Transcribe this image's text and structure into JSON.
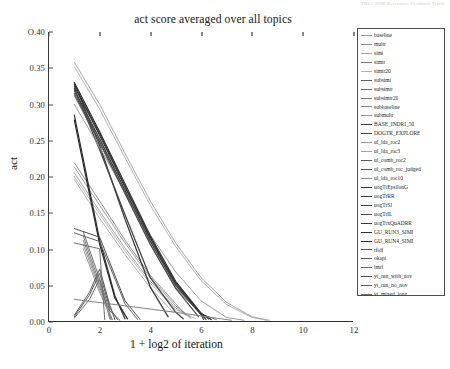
{
  "header": {
    "scan_artifact": "TREC 2008 Relevance Feedback Track"
  },
  "chart_data": {
    "type": "line",
    "title": "act score averaged over all topics",
    "xlabel": "1 + log2 of iteration",
    "ylabel": "act",
    "xlim": [
      0,
      12
    ],
    "ylim": [
      0.0,
      0.4
    ],
    "xticks": [
      0,
      2,
      4,
      6,
      8,
      10,
      12
    ],
    "xticklabels": [
      "0",
      "2",
      "4",
      "6",
      "8",
      "10",
      "12"
    ],
    "yticks": [
      0.0,
      0.05,
      0.1,
      0.15,
      0.2,
      0.25,
      0.3,
      0.35,
      0.4
    ],
    "yticklabels": [
      "0.00",
      "0.05",
      "0.10",
      "0.15",
      "0.20",
      "0.25",
      "0.30",
      "0.35",
      "O.40"
    ],
    "grid": false,
    "legend_position": "upper right",
    "series": [
      {
        "name": "baseline",
        "color": "#9a9a9a",
        "width": 0.9,
        "x": [
          1,
          2,
          3,
          4,
          5,
          5.6
        ],
        "y": [
          0.205,
          0.152,
          0.101,
          0.055,
          0.018,
          0.004
        ]
      },
      {
        "name": "multr",
        "color": "#8e8e8e",
        "width": 0.9,
        "x": [
          1,
          2,
          3,
          4,
          5,
          5.6
        ],
        "y": [
          0.213,
          0.16,
          0.108,
          0.06,
          0.021,
          0.005
        ]
      },
      {
        "name": "simi",
        "color": "#a6a6a6",
        "width": 0.9,
        "x": [
          1,
          2,
          3,
          4,
          4.9
        ],
        "y": [
          0.196,
          0.142,
          0.092,
          0.046,
          0.012
        ]
      },
      {
        "name": "simtr",
        "color": "#7e7e7e",
        "width": 0.9,
        "x": [
          1,
          2,
          3,
          4,
          5,
          5.4
        ],
        "y": [
          0.219,
          0.166,
          0.112,
          0.063,
          0.024,
          0.008
        ]
      },
      {
        "name": "simtr20",
        "color": "#b0b0b0",
        "width": 0.9,
        "x": [
          1,
          2,
          3,
          4,
          5,
          5.8
        ],
        "y": [
          0.2,
          0.148,
          0.097,
          0.052,
          0.016,
          0.003
        ]
      },
      {
        "name": "subsimi",
        "color": "#606060",
        "width": 0.9,
        "x": [
          1.35,
          2.0,
          2.4
        ],
        "y": [
          0.124,
          0.058,
          0.003
        ]
      },
      {
        "name": "subsimtr",
        "color": "#6d6d6d",
        "width": 0.9,
        "x": [
          1.35,
          2.0,
          2.45
        ],
        "y": [
          0.118,
          0.052,
          0.002
        ]
      },
      {
        "name": "subsimtr20",
        "color": "#787878",
        "width": 0.9,
        "x": [
          1.35,
          2.0,
          2.5
        ],
        "y": [
          0.112,
          0.047,
          0.002
        ]
      },
      {
        "name": "subbaseline",
        "color": "#8a8a8a",
        "width": 0.9,
        "x": [
          1.35,
          2.0,
          2.45
        ],
        "y": [
          0.106,
          0.043,
          0.002
        ]
      },
      {
        "name": "submultr",
        "color": "#969696",
        "width": 0.9,
        "x": [
          1.35,
          2.0,
          2.5
        ],
        "y": [
          0.1,
          0.039,
          0.002
        ]
      },
      {
        "name": "BASE_INDRI_50",
        "color": "#3c3c3c",
        "width": 1.3,
        "x": [
          1,
          2,
          3,
          4,
          4.7
        ],
        "y": [
          0.329,
          0.243,
          0.141,
          0.047,
          0.006
        ]
      },
      {
        "name": "DOGTR_EXPLORE",
        "color": "#474747",
        "width": 1.3,
        "x": [
          1,
          2,
          3,
          4,
          5,
          5.3
        ],
        "y": [
          0.322,
          0.237,
          0.147,
          0.06,
          0.012,
          0.003
        ]
      },
      {
        "name": "ul_lda_roc2",
        "color": "#9d9d9d",
        "width": 0.9,
        "x": [
          1,
          2,
          3,
          4,
          5,
          6,
          7,
          8,
          8.7
        ],
        "y": [
          0.358,
          0.3,
          0.232,
          0.166,
          0.108,
          0.06,
          0.026,
          0.006,
          0.001
        ]
      },
      {
        "name": "ul_lda_roc3",
        "color": "#a9a9a9",
        "width": 0.9,
        "x": [
          1,
          2,
          3,
          4,
          5,
          6,
          7,
          8,
          8.6
        ],
        "y": [
          0.352,
          0.293,
          0.226,
          0.16,
          0.103,
          0.056,
          0.023,
          0.005,
          0.001
        ]
      },
      {
        "name": "ul_comb_roc2",
        "color": "#5a5a5a",
        "width": 0.9,
        "x": [
          1,
          2,
          3,
          4,
          5,
          6,
          6.6
        ],
        "y": [
          0.318,
          0.252,
          0.181,
          0.111,
          0.05,
          0.01,
          0.002
        ]
      },
      {
        "name": "ul_comb_roc_judged",
        "color": "#545454",
        "width": 0.9,
        "x": [
          1,
          2,
          3,
          4,
          5,
          6,
          6.4
        ],
        "y": [
          0.312,
          0.246,
          0.176,
          0.106,
          0.046,
          0.009,
          0.002
        ]
      },
      {
        "name": "ul_lda_roc10",
        "color": "#8f8f8f",
        "width": 0.9,
        "x": [
          1,
          2,
          3,
          4,
          5,
          6,
          7,
          7.7
        ],
        "y": [
          0.3,
          0.24,
          0.178,
          0.119,
          0.068,
          0.028,
          0.005,
          0.001
        ]
      },
      {
        "name": "uogTrEpsilonG",
        "color": "#333333",
        "width": 1.2,
        "x": [
          1,
          2,
          3,
          4,
          5,
          6,
          6.3
        ],
        "y": [
          0.33,
          0.262,
          0.19,
          0.118,
          0.055,
          0.011,
          0.003
        ]
      },
      {
        "name": "uogTrRR",
        "color": "#3a3a3a",
        "width": 1.2,
        "x": [
          1,
          2,
          3,
          4,
          5,
          6,
          6.2
        ],
        "y": [
          0.325,
          0.257,
          0.185,
          0.114,
          0.052,
          0.01,
          0.002
        ]
      },
      {
        "name": "uogTrSJ",
        "color": "#424242",
        "width": 1.2,
        "x": [
          1,
          2,
          3,
          4,
          5,
          6,
          6.1
        ],
        "y": [
          0.32,
          0.252,
          0.181,
          0.11,
          0.049,
          0.009,
          0.002
        ]
      },
      {
        "name": "uogTrIL",
        "color": "#4b4b4b",
        "width": 1.2,
        "x": [
          1,
          2,
          3,
          4,
          5,
          5.9
        ],
        "y": [
          0.315,
          0.248,
          0.177,
          0.106,
          0.045,
          0.006
        ]
      },
      {
        "name": "uogTrxQuADRR",
        "color": "#383838",
        "width": 1.2,
        "x": [
          1,
          2,
          3,
          4,
          5,
          6,
          6.4
        ],
        "y": [
          0.327,
          0.259,
          0.187,
          0.116,
          0.053,
          0.01,
          0.002
        ]
      },
      {
        "name": "GU_RUN3_SIMI",
        "color": "#2f2f2f",
        "width": 1.2,
        "x": [
          1,
          2,
          2.6,
          3.0
        ],
        "y": [
          0.285,
          0.112,
          0.035,
          0.003
        ]
      },
      {
        "name": "GU_RUN4_SIMI",
        "color": "#2b2b2b",
        "width": 1.2,
        "x": [
          1,
          2,
          2.6,
          3.1
        ],
        "y": [
          0.278,
          0.106,
          0.032,
          0.003
        ]
      },
      {
        "name": "tfidf",
        "color": "#555555",
        "width": 1.0,
        "x": [
          1,
          1.6,
          2.0,
          2.4,
          2.6
        ],
        "y": [
          0.008,
          0.04,
          0.072,
          0.022,
          0.002
        ]
      },
      {
        "name": "okapi",
        "color": "#5e5e5e",
        "width": 1.0,
        "x": [
          1,
          1.6,
          2.0,
          2.4,
          2.7
        ],
        "y": [
          0.006,
          0.036,
          0.066,
          0.018,
          0.002
        ]
      },
      {
        "name": "lmrf",
        "color": "#676767",
        "width": 1.0,
        "x": [
          1,
          1.6,
          2.0,
          2.4,
          2.8
        ],
        "y": [
          0.004,
          0.03,
          0.058,
          0.014,
          0.001
        ]
      },
      {
        "name": "yt_run_with_nov",
        "color": "#4f4f4f",
        "width": 1.0,
        "x": [
          1,
          2,
          3,
          3.6
        ],
        "y": [
          0.128,
          0.116,
          0.028,
          0.002
        ]
      },
      {
        "name": "yt_run_no_nov",
        "color": "#606060",
        "width": 1.0,
        "x": [
          1,
          2,
          3,
          3.5
        ],
        "y": [
          0.122,
          0.11,
          0.024,
          0.002
        ]
      },
      {
        "name": "yt_mixed_long",
        "color": "#717171",
        "width": 1.0,
        "x": [
          1,
          2.0,
          2.2
        ],
        "y": [
          0.108,
          0.1,
          0.002
        ]
      },
      {
        "name": "yt_mixed_sim_nov",
        "color": "#838383",
        "width": 1.0,
        "x": [
          1,
          5.0,
          7.2
        ],
        "y": [
          0.03,
          0.012,
          0.001
        ]
      }
    ]
  },
  "legend": {
    "entries": [
      {
        "label": "baseline",
        "color": "#9a9a9a",
        "width": 0.9
      },
      {
        "label": "multr",
        "color": "#8e8e8e",
        "width": 0.9
      },
      {
        "label": "simi",
        "color": "#a6a6a6",
        "width": 0.9
      },
      {
        "label": "simtr",
        "color": "#7e7e7e",
        "width": 0.9
      },
      {
        "label": "simtr20",
        "color": "#b0b0b0",
        "width": 0.9
      },
      {
        "label": "subsimi",
        "color": "#606060",
        "width": 0.9
      },
      {
        "label": "subsimtr",
        "color": "#6d6d6d",
        "width": 0.9
      },
      {
        "label": "subsimtr20",
        "color": "#787878",
        "width": 0.9
      },
      {
        "label": "subbaseline",
        "color": "#8a8a8a",
        "width": 0.9
      },
      {
        "label": "submultr",
        "color": "#969696",
        "width": 0.9
      },
      {
        "label": "BASE_INDRI_50",
        "color": "#3c3c3c",
        "width": 1.6
      },
      {
        "label": "DOGTR_EXPLORE",
        "color": "#474747",
        "width": 1.6
      },
      {
        "label": "ul_lda_roc2",
        "color": "#9d9d9d",
        "width": 0.9
      },
      {
        "label": "ul_lda_roc3",
        "color": "#a9a9a9",
        "width": 0.9
      },
      {
        "label": "ul_comb_roc2",
        "color": "#5a5a5a",
        "width": 0.9
      },
      {
        "label": "ul_comb_roc_judged",
        "color": "#545454",
        "width": 0.9
      },
      {
        "label": "ul_lda_roc10",
        "color": "#8f8f8f",
        "width": 0.9
      },
      {
        "label": "uogTrEpsilonG",
        "color": "#333333",
        "width": 1.6
      },
      {
        "label": "uogTrRR",
        "color": "#3a3a3a",
        "width": 1.6
      },
      {
        "label": "uogTrSJ",
        "color": "#424242",
        "width": 1.6
      },
      {
        "label": "uogTrIL",
        "color": "#4b4b4b",
        "width": 1.6
      },
      {
        "label": "uogTrxQuADRR",
        "color": "#383838",
        "width": 1.6
      },
      {
        "label": "GU_RUN3_SIMI",
        "color": "#2f2f2f",
        "width": 1.6
      },
      {
        "label": "GU_RUN4_SIMI",
        "color": "#2b2b2b",
        "width": 1.6
      },
      {
        "label": "tfidf",
        "color": "#555555",
        "width": 1.4
      },
      {
        "label": "okapi",
        "color": "#5e5e5e",
        "width": 1.4
      },
      {
        "label": "lmrf",
        "color": "#676767",
        "width": 1.4
      },
      {
        "label": "yt_run_with_nov",
        "color": "#4f4f4f",
        "width": 1.4
      },
      {
        "label": "yt_run_no_nov",
        "color": "#606060",
        "width": 1.4
      },
      {
        "label": "yt_mixed_long",
        "color": "#717171",
        "width": 1.4
      },
      {
        "label": "yt_mixed_sim_nov",
        "color": "#838383",
        "width": 1.4
      }
    ]
  }
}
